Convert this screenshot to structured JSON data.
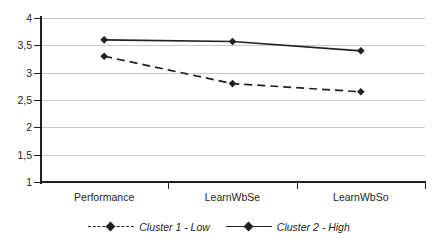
{
  "chart_data": {
    "type": "line",
    "title": "",
    "xlabel": "",
    "ylabel": "",
    "categories": [
      "Performance",
      "LearnWbSe",
      "LearnWbSo"
    ],
    "series": [
      {
        "name": "Cluster 1 - Low",
        "values": [
          3.3,
          2.8,
          2.65
        ],
        "style": "dashed",
        "marker": "diamond",
        "color": "#231f20"
      },
      {
        "name": "Cluster 2 - High",
        "values": [
          3.6,
          3.57,
          3.4
        ],
        "style": "solid",
        "marker": "diamond",
        "color": "#231f20"
      }
    ],
    "ylim": [
      1,
      4
    ],
    "ytick_values": [
      1,
      1.5,
      2,
      2.5,
      3,
      3.5,
      4
    ],
    "ytick_labels": [
      "1",
      "1,5",
      "2",
      "2,5",
      "3",
      "3,5",
      "4"
    ],
    "grid": "horizontal",
    "legend_position": "bottom-center",
    "decimal_separator": ","
  },
  "legend": {
    "entries": [
      {
        "label": "Cluster 1 - Low"
      },
      {
        "label": "Cluster 2 - High"
      }
    ]
  },
  "colors": {
    "line": "#231f20",
    "gridline": "#c8c8c8",
    "axis": "#231f20",
    "background": "#ffffff"
  }
}
